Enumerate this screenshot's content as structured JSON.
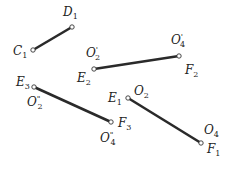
{
  "diagram": {
    "segments": [
      {
        "id": "C1D1",
        "x1": 33,
        "y1": 50,
        "x2": 72,
        "y2": 27
      },
      {
        "id": "E2F2",
        "x1": 94,
        "y1": 69,
        "x2": 179,
        "y2": 56
      },
      {
        "id": "E3F3",
        "x1": 34,
        "y1": 87,
        "x2": 111,
        "y2": 122
      },
      {
        "id": "E1F1",
        "x1": 128,
        "y1": 98,
        "x2": 201,
        "y2": 143
      }
    ],
    "labels": [
      {
        "main": "D",
        "sub": "1",
        "prime": "",
        "x": 63,
        "y": 16
      },
      {
        "main": "C",
        "sub": "1",
        "prime": "",
        "x": 13,
        "y": 55
      },
      {
        "main": "O",
        "sub": "2",
        "prime": "'",
        "x": 86,
        "y": 57
      },
      {
        "main": "E",
        "sub": "2",
        "prime": "",
        "x": 77,
        "y": 82
      },
      {
        "main": "O",
        "sub": "4",
        "prime": "'",
        "x": 171,
        "y": 44
      },
      {
        "main": "F",
        "sub": "2",
        "prime": "",
        "x": 185,
        "y": 74
      },
      {
        "main": "E",
        "sub": "3",
        "prime": "",
        "x": 16,
        "y": 86
      },
      {
        "main": "O",
        "sub": "2",
        "prime": "\"",
        "x": 27,
        "y": 106
      },
      {
        "main": "E",
        "sub": "1",
        "prime": "",
        "x": 108,
        "y": 102
      },
      {
        "main": "O",
        "sub": "2",
        "prime": "",
        "x": 134,
        "y": 95
      },
      {
        "main": "F",
        "sub": "3",
        "prime": "",
        "x": 118,
        "y": 127
      },
      {
        "main": "O",
        "sub": "4",
        "prime": "\"",
        "x": 100,
        "y": 142
      },
      {
        "main": "O",
        "sub": "4",
        "prime": "",
        "x": 204,
        "y": 134
      },
      {
        "main": "F",
        "sub": "1",
        "prime": "",
        "x": 207,
        "y": 153
      }
    ]
  }
}
